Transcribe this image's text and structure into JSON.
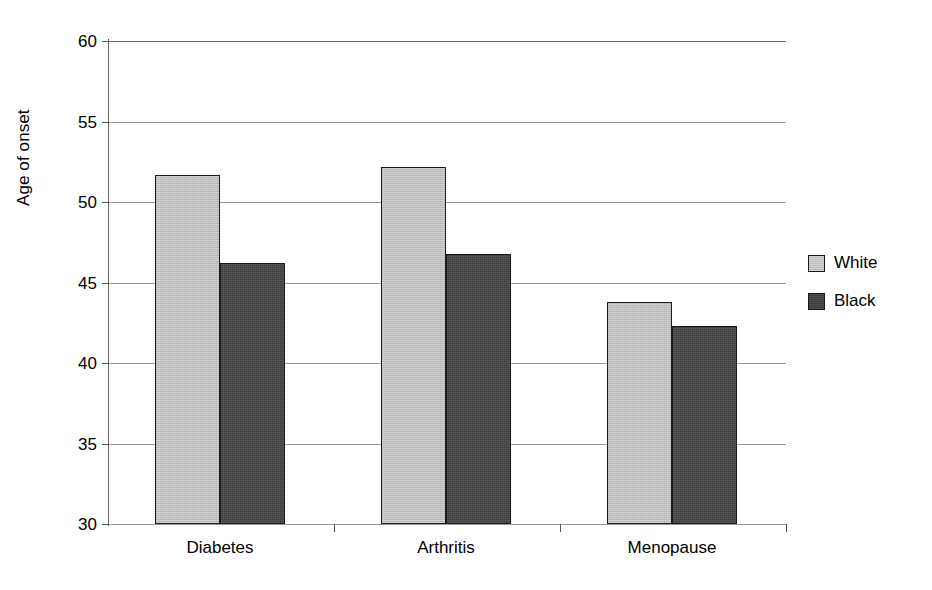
{
  "chart_data": {
    "type": "bar",
    "title": "",
    "xlabel": "",
    "ylabel": "Age of onset",
    "categories": [
      "Diabetes",
      "Arthritis",
      "Menopause"
    ],
    "series": [
      {
        "name": "White",
        "color": "#bdbdbd",
        "values": [
          51.7,
          52.2,
          43.8
        ]
      },
      {
        "name": "Black",
        "color": "#3d3d3d",
        "values": [
          46.2,
          46.8,
          42.3
        ]
      }
    ],
    "ylim": [
      30,
      60
    ],
    "yticks": [
      30,
      35,
      40,
      45,
      50,
      55,
      60
    ],
    "ytick_labels": [
      "30",
      "35",
      "40",
      "45",
      "50",
      "55",
      "60"
    ],
    "grid": true,
    "legend_position": "right",
    "axis_color": "#6b6b6b",
    "grid_color": "#999999",
    "bar_outline_color": "#1a1a1a"
  }
}
